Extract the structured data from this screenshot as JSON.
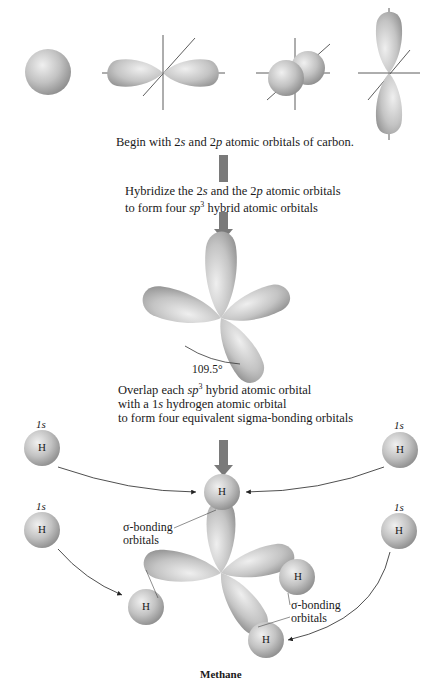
{
  "step1": {
    "text_parts": [
      "Begin with ",
      "2",
      "s",
      " and ",
      "2",
      "p",
      " atomic orbitals of carbon."
    ]
  },
  "step2": {
    "line1_parts": [
      "Hybridize the ",
      "2",
      "s",
      " and the ",
      "2",
      "p",
      " atomic orbitals"
    ],
    "line2_parts": [
      "to form four ",
      "sp",
      "3",
      " hybrid atomic orbitals"
    ]
  },
  "angle_label": "109.5°",
  "step3": {
    "line1_parts": [
      "Overlap each ",
      "sp",
      "3",
      " hybrid atomic orbital"
    ],
    "line2_parts": [
      "with a ",
      "1",
      "s",
      " hydrogen atomic orbital"
    ],
    "line3": "to form four equivalent sigma-bonding orbitals"
  },
  "hydrogen": {
    "orbital_label": "1s",
    "atom_symbol": "H"
  },
  "sigma_labels": {
    "left_line1": "σ-bonding",
    "left_line2": "orbitals",
    "right_line1": "σ-bonding",
    "right_line2": "orbitals"
  },
  "caption": "Methane",
  "colors": {
    "orbital_fill": "#bdbdbd",
    "orbital_highlight": "#eeeeee",
    "orbital_shadow": "#8f8f8f",
    "arrow": "#7a7a7a",
    "axis": "#333333"
  }
}
